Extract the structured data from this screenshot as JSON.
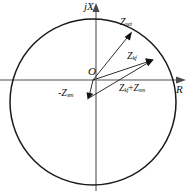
{
  "diagram": {
    "type": "complex-impedance-plane",
    "axes": {
      "vertical_label": "jX",
      "horizontal_label": "R",
      "origin_label": "O"
    },
    "circle": {
      "center": [
        93,
        102
      ],
      "radius": 83,
      "stroke": "#1a1a1a"
    },
    "vectors": [
      {
        "name": "z-set",
        "label_main": "Z",
        "label_sub": "set",
        "from": [
          93,
          80
        ],
        "to": [
          131,
          33
        ]
      },
      {
        "name": "z-kf",
        "label_main": "Z",
        "label_sub": "kf",
        "from": [
          93,
          80
        ],
        "to": [
          152,
          60
        ]
      },
      {
        "name": "neg-z-sm",
        "label_main": "-Z",
        "label_sub": "sm",
        "from": [
          93,
          80
        ],
        "to": [
          88,
          98
        ]
      },
      {
        "name": "z-kf-plus-z-sm",
        "label_main_a": "Z",
        "label_sub_a": "kf",
        "operator": "+",
        "label_main_b": "Z",
        "label_sub_b": "sm",
        "from": [
          88,
          98
        ],
        "to": [
          152,
          60
        ]
      }
    ],
    "colors": {
      "stroke": "#1a1a1a",
      "axis": "#777777",
      "background": "#ffffff"
    }
  }
}
